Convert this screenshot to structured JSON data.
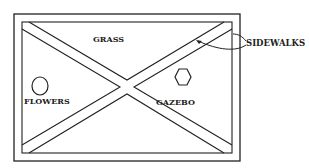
{
  "diagram": {
    "type": "park-layout-sketch",
    "labels": {
      "grass": "GRASS",
      "sidewalks": "SIDEWALKS",
      "flowers": "FLOWERS",
      "gazebo": "GAZEBO"
    },
    "shapes": {
      "flowers": "circle",
      "gazebo": "hexagon"
    },
    "colors": {
      "stroke": "#222222",
      "background": "#ffffff"
    }
  }
}
